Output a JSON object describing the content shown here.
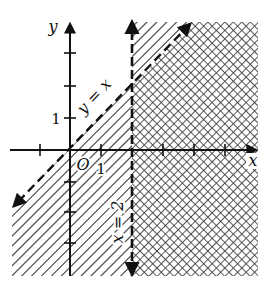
{
  "diagram": {
    "type": "inequality-graph",
    "axes": {
      "x_label": "x",
      "y_label": "y",
      "origin_label": "O",
      "x_tick_label": "1",
      "y_tick_label": "1",
      "x_ticks": [
        -1,
        0,
        1,
        2,
        3,
        4,
        5
      ],
      "y_ticks": [
        -3,
        -2,
        -1,
        0,
        1,
        2,
        3
      ]
    },
    "lines": [
      {
        "name": "y = x",
        "label": "y = x",
        "style": "dashed",
        "arrows": "both"
      },
      {
        "name": "x = 2",
        "label": "x = 2",
        "style": "dashed",
        "arrows": "both"
      }
    ],
    "regions": [
      {
        "name": "y < x",
        "pattern": "diagonal-hatch"
      },
      {
        "name": "x > 2",
        "pattern": "cross-hatch"
      }
    ],
    "colors": {
      "ink": "#111111",
      "background": "#ffffff",
      "hatch": "#555555"
    }
  }
}
